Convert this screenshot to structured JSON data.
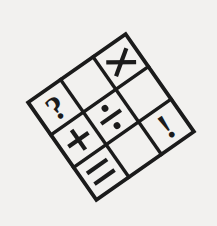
{
  "figure": {
    "background_color": "#f2f1ef",
    "ink_color": "#1b1b1b",
    "rotation_degrees": -35,
    "corners": {
      "top": [
        95,
        32
      ],
      "right": [
        192,
        100
      ],
      "bottom": [
        128,
        202
      ],
      "left": [
        30,
        135
      ]
    }
  },
  "grid": {
    "rows": 3,
    "columns": 3,
    "cells": [
      {
        "row": 0,
        "col": 0,
        "symbol": "?",
        "name": "question-mark",
        "empty": false
      },
      {
        "row": 0,
        "col": 1,
        "symbol": "",
        "name": "empty",
        "empty": true
      },
      {
        "row": 0,
        "col": 2,
        "symbol": "×",
        "name": "multiplication-sign",
        "empty": false
      },
      {
        "row": 1,
        "col": 0,
        "symbol": "+",
        "name": "plus-sign",
        "empty": false
      },
      {
        "row": 1,
        "col": 1,
        "symbol": "÷",
        "name": "division-sign",
        "empty": false
      },
      {
        "row": 1,
        "col": 2,
        "symbol": "",
        "name": "empty",
        "empty": true
      },
      {
        "row": 2,
        "col": 0,
        "symbol": "=",
        "name": "equals-sign",
        "empty": false
      },
      {
        "row": 2,
        "col": 1,
        "symbol": "",
        "name": "empty",
        "empty": true
      },
      {
        "row": 2,
        "col": 2,
        "symbol": "!",
        "name": "exclamation-mark",
        "empty": false
      }
    ]
  }
}
